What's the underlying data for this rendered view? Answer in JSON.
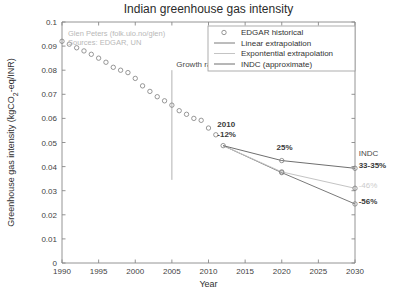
{
  "chart_data": {
    "type": "line",
    "title": "Indian greenhouse gas intensity",
    "xlabel": "Year",
    "ylabel": "Greenhouse gas intensity (kgCO2-eq/INR)",
    "ylabel_parts": {
      "pre": "Greenhouse gas intensity (kgCO",
      "sub": "2",
      "post": "-eq/INR)"
    },
    "xlim": [
      1990,
      2030
    ],
    "ylim": [
      0,
      0.1
    ],
    "xticks": [
      1990,
      1995,
      2000,
      2005,
      2010,
      2015,
      2020,
      2025,
      2030
    ],
    "xtick_labels": [
      "1990",
      "1995",
      "2000",
      "2005",
      "2010",
      "2015",
      "2020",
      "2025",
      "2030"
    ],
    "yticks": [
      0,
      0.01,
      0.02,
      0.03,
      0.04,
      0.05,
      0.06,
      0.07,
      0.08,
      0.09,
      0.1
    ],
    "ytick_labels": [
      "0",
      "0.01",
      "0.02",
      "0.03",
      "0.04",
      "0.05",
      "0.06",
      "0.07",
      "0.08",
      "0.09",
      "0.1"
    ],
    "grid": false,
    "legend_position": "top-right",
    "series": [
      {
        "name": "EDGAR historical",
        "style": "markers",
        "color": "#7d7d7d",
        "x": [
          1990,
          1991,
          1992,
          1993,
          1994,
          1995,
          1996,
          1997,
          1998,
          1999,
          2000,
          2001,
          2002,
          2003,
          2004,
          2005,
          2006,
          2007,
          2008,
          2009,
          2010,
          2011,
          2012
        ],
        "values": [
          0.092,
          0.0908,
          0.0893,
          0.088,
          0.0866,
          0.085,
          0.0833,
          0.0812,
          0.08,
          0.079,
          0.0766,
          0.0735,
          0.0712,
          0.069,
          0.0673,
          0.0655,
          0.0632,
          0.0617,
          0.06,
          0.0592,
          0.056,
          0.0532,
          0.0487
        ]
      },
      {
        "name": "Linear extrapolation",
        "style": "line-markers",
        "color": "#7a7a7a",
        "x": [
          2012,
          2020,
          2030
        ],
        "values": [
          0.0487,
          0.0375,
          0.0245
        ]
      },
      {
        "name": "Expontential extrapolation",
        "style": "line-markers",
        "color": "#c4c4c4",
        "x": [
          2012,
          2020,
          2030
        ],
        "values": [
          0.0487,
          0.0378,
          0.031
        ]
      },
      {
        "name": "INDC (approximate)",
        "style": "line-markers",
        "color": "#6f6f6f",
        "x": [
          2012,
          2020,
          2030
        ],
        "values": [
          0.0487,
          0.0425,
          0.0393
        ]
      }
    ],
    "reference_line": {
      "name": "2005 reference",
      "x": 2005,
      "y_from": 0.0345,
      "y_to": 0.08
    },
    "annotations": [
      {
        "id": "growth-rates-note",
        "text": "Growth rates relative to 2005",
        "x": 2005.6,
        "y": 0.0815
      },
      {
        "id": "year-2010-label",
        "text": "2010",
        "x": 2011.2,
        "y": 0.0565
      },
      {
        "id": "pct-2010-label",
        "text": "-12%",
        "x": 2011.2,
        "y": 0.0522
      },
      {
        "id": "pct-2020-label",
        "text": "25%",
        "x": 2019.3,
        "y": 0.0468
      },
      {
        "id": "indc-label",
        "text": "INDC",
        "x": 2030.5,
        "y": 0.0442
      },
      {
        "id": "indc-range-label",
        "text": "33-35%",
        "x": 2030.5,
        "y": 0.0396
      },
      {
        "id": "pct-exp-2030-label",
        "text": "-46%",
        "x": 2030.5,
        "y": 0.031
      },
      {
        "id": "pct-lin-2030-label",
        "text": "-56%",
        "x": 2030.5,
        "y": 0.0243
      }
    ],
    "credit_lines": [
      "Glen Peters (folk.uio.no/glen)",
      "Sources: EDGAR, UN"
    ],
    "legend_entries": [
      {
        "label": "EDGAR historical",
        "marker": "circle",
        "color": "#7d7d7d"
      },
      {
        "label": "Linear extrapolation",
        "marker": "line",
        "color": "#7a7a7a"
      },
      {
        "label": "Expontential extrapolation",
        "marker": "line",
        "color": "#c4c4c4"
      },
      {
        "label": "INDC (approximate)",
        "marker": "line",
        "color": "#6f6f6f"
      }
    ]
  }
}
